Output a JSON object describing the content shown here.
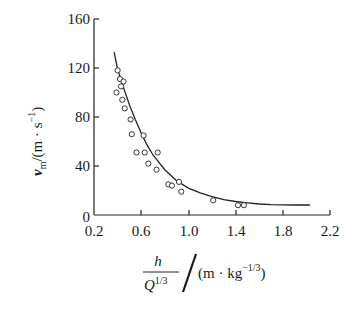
{
  "chart_data": {
    "type": "scatter",
    "title": "",
    "xlabel": "h / Q^(1/3) / (m · kg^-1/3)",
    "ylabel": "v_m / (m · s^-1)",
    "xlim": [
      0.2,
      2.2
    ],
    "ylim": [
      0,
      160
    ],
    "x_ticks": [
      0.2,
      0.6,
      1.0,
      1.4,
      1.8,
      2.2
    ],
    "y_ticks": [
      0,
      40,
      80,
      120,
      160
    ],
    "grid": false,
    "legend": null,
    "series": [
      {
        "name": "measured",
        "kind": "scatter",
        "marker": "open-circle",
        "points": [
          [
            0.4,
            118
          ],
          [
            0.42,
            111
          ],
          [
            0.45,
            109
          ],
          [
            0.43,
            105
          ],
          [
            0.39,
            100
          ],
          [
            0.44,
            94
          ],
          [
            0.46,
            87
          ],
          [
            0.51,
            78
          ],
          [
            0.52,
            66
          ],
          [
            0.62,
            65
          ],
          [
            0.56,
            51
          ],
          [
            0.63,
            51
          ],
          [
            0.74,
            51
          ],
          [
            0.66,
            42
          ],
          [
            0.73,
            37
          ],
          [
            0.83,
            25
          ],
          [
            0.86,
            24
          ],
          [
            0.92,
            27
          ],
          [
            0.94,
            19
          ],
          [
            1.21,
            12
          ],
          [
            1.42,
            8
          ],
          [
            1.47,
            8
          ]
        ]
      },
      {
        "name": "fit",
        "kind": "line",
        "points": [
          [
            0.37,
            133
          ],
          [
            0.4,
            119
          ],
          [
            0.45,
            104
          ],
          [
            0.5,
            90
          ],
          [
            0.55,
            78
          ],
          [
            0.6,
            67
          ],
          [
            0.65,
            57
          ],
          [
            0.7,
            49
          ],
          [
            0.8,
            37
          ],
          [
            0.9,
            28
          ],
          [
            1.0,
            22
          ],
          [
            1.1,
            18
          ],
          [
            1.2,
            15
          ],
          [
            1.3,
            12.5
          ],
          [
            1.4,
            11
          ],
          [
            1.5,
            10
          ],
          [
            1.6,
            9
          ],
          [
            1.7,
            8.5
          ],
          [
            1.8,
            8.3
          ],
          [
            1.9,
            8.2
          ],
          [
            2.03,
            8.2
          ]
        ]
      }
    ]
  },
  "labels": {
    "y_tick_0": "0",
    "y_tick_40": "40",
    "y_tick_80": "80",
    "y_tick_120": "120",
    "y_tick_160": "160",
    "x_tick_02": "0.2",
    "x_tick_06": "0.6",
    "x_tick_10": "1.0",
    "x_tick_14": "1.4",
    "x_tick_18": "1.8",
    "x_tick_22": "2.2",
    "y_axis_symbol": "v",
    "y_axis_sub": "m",
    "y_axis_unit_open": "/(m · s",
    "y_axis_unit_exp": "−1",
    "y_axis_unit_close": ")",
    "x_axis_numerator": "h",
    "x_axis_denominator": "Q",
    "x_axis_den_exp": "1/3",
    "x_axis_unit_open": "(m · kg",
    "x_axis_unit_exp": "−1/3",
    "x_axis_unit_close": ")"
  }
}
